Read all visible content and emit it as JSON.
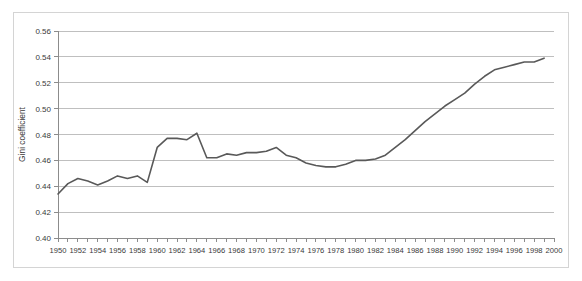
{
  "chart_data": {
    "type": "line",
    "title": "",
    "xlabel": "",
    "ylabel": "Gini coefficient",
    "ylim": [
      0.4,
      0.56
    ],
    "xlim": [
      1950,
      2000
    ],
    "ytick_step": 0.02,
    "yticks": [
      "0.40",
      "0.42",
      "0.44",
      "0.46",
      "0.48",
      "0.50",
      "0.52",
      "0.54",
      "0.56"
    ],
    "ytick_values": [
      0.4,
      0.42,
      0.44,
      0.46,
      0.48,
      0.5,
      0.52,
      0.54,
      0.56
    ],
    "xticks": [
      "1950",
      "1952",
      "1954",
      "1956",
      "1958",
      "1960",
      "1962",
      "1964",
      "1966",
      "1968",
      "1970",
      "1972",
      "1974",
      "1976",
      "1978",
      "1980",
      "1982",
      "1984",
      "1986",
      "1988",
      "1990",
      "1992",
      "1994",
      "1996",
      "1998",
      "2000"
    ],
    "xtick_values": [
      1950,
      1952,
      1954,
      1956,
      1958,
      1960,
      1962,
      1964,
      1966,
      1968,
      1970,
      1972,
      1974,
      1976,
      1978,
      1980,
      1982,
      1984,
      1986,
      1988,
      1990,
      1992,
      1994,
      1996,
      1998,
      2000
    ],
    "minor_xtick_values": [
      1950,
      1951,
      1952,
      1953,
      1954,
      1955,
      1956,
      1957,
      1958,
      1959,
      1960,
      1961,
      1962,
      1963,
      1964,
      1965,
      1966,
      1967,
      1968,
      1969,
      1970,
      1971,
      1972,
      1973,
      1974,
      1975,
      1976,
      1977,
      1978,
      1979,
      1980,
      1981,
      1982,
      1983,
      1984,
      1985,
      1986,
      1987,
      1988,
      1989,
      1990,
      1991,
      1992,
      1993,
      1994,
      1995,
      1996,
      1997,
      1998,
      1999,
      2000
    ],
    "grid": true,
    "grid_axis": "y",
    "legend": false,
    "line_color": "#595959",
    "grid_color": "#bfbfbf",
    "axis_color": "#8c8c8c",
    "background_color": "#ffffff",
    "x": [
      1950,
      1951,
      1952,
      1953,
      1954,
      1955,
      1956,
      1957,
      1958,
      1959,
      1960,
      1961,
      1962,
      1963,
      1964,
      1965,
      1966,
      1967,
      1968,
      1969,
      1970,
      1971,
      1972,
      1973,
      1974,
      1975,
      1976,
      1977,
      1978,
      1979,
      1980,
      1981,
      1982,
      1983,
      1984,
      1985,
      1986,
      1987,
      1988,
      1989,
      1990,
      1991,
      1992,
      1993,
      1994,
      1995,
      1996,
      1997,
      1998,
      1999
    ],
    "values": [
      0.434,
      0.442,
      0.446,
      0.444,
      0.441,
      0.444,
      0.448,
      0.446,
      0.448,
      0.443,
      0.47,
      0.477,
      0.477,
      0.476,
      0.481,
      0.462,
      0.462,
      0.465,
      0.464,
      0.466,
      0.466,
      0.467,
      0.47,
      0.464,
      0.462,
      0.458,
      0.456,
      0.455,
      0.455,
      0.457,
      0.46,
      0.46,
      0.461,
      0.464,
      0.47,
      0.476,
      0.483,
      0.49,
      0.496,
      0.502,
      0.507,
      0.512,
      0.519,
      0.525,
      0.53,
      0.532,
      0.534,
      0.536,
      0.536,
      0.539
    ],
    "series": [
      {
        "name": "Gini coefficient",
        "values": [
          0.434,
          0.442,
          0.446,
          0.444,
          0.441,
          0.444,
          0.448,
          0.446,
          0.448,
          0.443,
          0.47,
          0.477,
          0.477,
          0.476,
          0.481,
          0.462,
          0.462,
          0.465,
          0.464,
          0.466,
          0.466,
          0.467,
          0.47,
          0.464,
          0.462,
          0.458,
          0.456,
          0.455,
          0.455,
          0.457,
          0.46,
          0.46,
          0.461,
          0.464,
          0.47,
          0.476,
          0.483,
          0.49,
          0.496,
          0.502,
          0.507,
          0.512,
          0.519,
          0.525,
          0.53,
          0.532,
          0.534,
          0.536,
          0.536,
          0.539
        ]
      }
    ]
  }
}
